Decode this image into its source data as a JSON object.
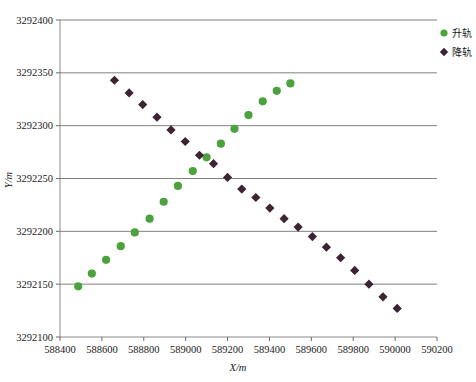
{
  "chart_data": {
    "type": "scatter",
    "title": "",
    "xlabel": "X/m",
    "ylabel": "Y/m",
    "xlim": [
      588400,
      590200
    ],
    "ylim": [
      3292100,
      3292400
    ],
    "xticks": [
      588400,
      588600,
      588800,
      589000,
      589200,
      589400,
      589600,
      589800,
      590000,
      590200
    ],
    "yticks": [
      3292100,
      3292150,
      3292200,
      3292250,
      3292300,
      3292350,
      3292400
    ],
    "xtick_labels": [
      "588400",
      "588600",
      "588800",
      "589000",
      "589200",
      "589400",
      "589600",
      "589800",
      "590000",
      "590200"
    ],
    "ytick_labels": [
      "3292100",
      "3292150",
      "3292200",
      "3292250",
      "3292300",
      "3292350",
      "3292400"
    ],
    "grid": "horizontal",
    "legend_position": "top-right",
    "series": [
      {
        "name": "升轨",
        "marker": "circle",
        "color": "#4ca23c",
        "points": [
          [
            588487,
            3292148
          ],
          [
            588552,
            3292160
          ],
          [
            588620,
            3292173
          ],
          [
            588690,
            3292186
          ],
          [
            588757,
            3292199
          ],
          [
            588828,
            3292212
          ],
          [
            588895,
            3292228
          ],
          [
            588963,
            3292243
          ],
          [
            589034,
            3292257
          ],
          [
            589100,
            3292270
          ],
          [
            589168,
            3292283
          ],
          [
            589233,
            3292297
          ],
          [
            589300,
            3292310
          ],
          [
            589368,
            3292323
          ],
          [
            589435,
            3292333
          ],
          [
            589500,
            3292340
          ]
        ]
      },
      {
        "name": "降轨",
        "marker": "diamond",
        "color": "#3c2433",
        "points": [
          [
            588660,
            3292343
          ],
          [
            588730,
            3292331
          ],
          [
            588795,
            3292320
          ],
          [
            588863,
            3292308
          ],
          [
            588930,
            3292296
          ],
          [
            588998,
            3292285
          ],
          [
            589066,
            3292272
          ],
          [
            589133,
            3292264
          ],
          [
            589200,
            3292251
          ],
          [
            589268,
            3292240
          ],
          [
            589335,
            3292232
          ],
          [
            589402,
            3292222
          ],
          [
            589470,
            3292212
          ],
          [
            589537,
            3292204
          ],
          [
            589605,
            3292195
          ],
          [
            589672,
            3292185
          ],
          [
            589740,
            3292175
          ],
          [
            589807,
            3292163
          ],
          [
            589875,
            3292150
          ],
          [
            589942,
            3292138
          ],
          [
            590010,
            3292127
          ]
        ]
      }
    ]
  },
  "legend": {
    "entries": [
      {
        "label": "升轨",
        "marker": "circle",
        "color": "#4ca23c"
      },
      {
        "label": "降轨",
        "marker": "diamond",
        "color": "#3c2433"
      }
    ]
  },
  "axes": {
    "x_title": "X/m",
    "y_title": "Y/m"
  }
}
